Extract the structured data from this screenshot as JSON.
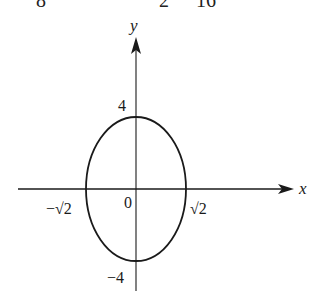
{
  "top_fragment": {
    "items": [
      {
        "text": "8",
        "x": 36
      },
      {
        "text": "2",
        "x": 159
      },
      {
        "text": "16",
        "x": 196
      }
    ]
  },
  "graph": {
    "axis_labels": {
      "x": "x",
      "y": "y"
    },
    "origin_label": "0",
    "ticks": {
      "y_pos": "4",
      "y_neg": "−4",
      "x_neg": "−√2",
      "x_pos": "√2"
    },
    "curve": {
      "type": "ellipse",
      "center": [
        0,
        0
      ],
      "semi_axis_x": "√2",
      "semi_axis_y": 4
    },
    "colors": {
      "stroke": "#1a1a1a",
      "background": "#ffffff"
    }
  }
}
